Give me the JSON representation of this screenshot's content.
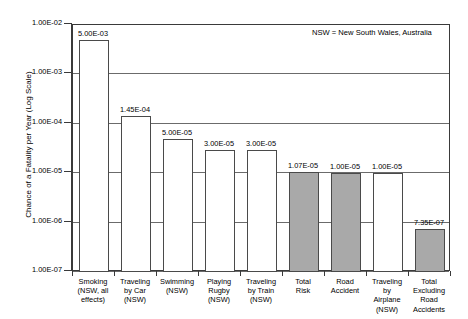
{
  "chart_data": {
    "type": "bar",
    "title": "",
    "xlabel": "",
    "ylabel": "Chance of a Fatality per Year (Log Scale)",
    "yscale": "log",
    "ylim": [
      1e-07,
      0.01
    ],
    "ytick_labels": [
      "1.00E-02",
      "1.00E-03",
      "1.00E-04",
      "1.00E-05",
      "1.00E-06",
      "1.00E-07"
    ],
    "ytick_values": [
      0.01,
      0.001,
      0.0001,
      1e-05,
      1e-06,
      1e-07
    ],
    "grid": true,
    "legend": false,
    "annotation": "NSW = New South Wales, Australia",
    "categories": [
      "Smoking\n(NSW, all\neffects)",
      "Traveling\nby Car\n(NSW)",
      "Swimming\n(NSW)",
      "Playing\nRugby\n(NSW)",
      "Traveling\nby Train\n(NSW)",
      "Total\nRisk",
      "Road\nAccident",
      "Traveling\nby\nAirplane\n(NSW)",
      "Total\nExcluding\nRoad\nAccidents"
    ],
    "values": [
      0.005,
      0.000145,
      5e-05,
      3e-05,
      3e-05,
      1.07e-05,
      1e-05,
      1e-05,
      7.35e-07
    ],
    "data_labels": [
      "5.00E-03",
      "1.45E-04",
      "5.00E-05",
      "3.00E-05",
      "3.00E-05",
      "1.07E-05",
      "1.00E-05",
      "1.00E-05",
      "7.35E-07"
    ],
    "bar_styles": [
      "open",
      "open",
      "open",
      "open",
      "open",
      "filled",
      "filled",
      "open",
      "filled"
    ],
    "colors": {
      "bar_open_fill": "#ffffff",
      "bar_filled_fill": "#a9a9a9",
      "bar_edge": "#4a4a4a",
      "axis": "#3a3a3a",
      "grid": "#6b6b6b",
      "text": "#000000",
      "background": "#ffffff"
    }
  }
}
